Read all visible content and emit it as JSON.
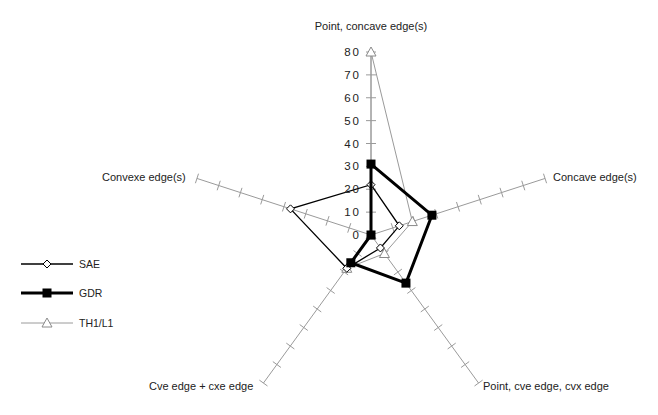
{
  "chart_data": {
    "type": "radar",
    "title": "",
    "axes": [
      "Point, concave edge(s)",
      "Concave edge(s)",
      "Point, cve edge, cvx edge",
      "Cve edge + cxe edge",
      "Convexe edge(s)"
    ],
    "radial_ticks": [
      0,
      10,
      20,
      30,
      40,
      50,
      60,
      70,
      80
    ],
    "rlim": [
      0,
      80
    ],
    "series": [
      {
        "name": "SAE",
        "values": [
          22,
          13,
          7,
          18,
          37
        ],
        "color": "#000000",
        "line_width": 1.3,
        "marker": "diamond-open"
      },
      {
        "name": "GDR",
        "values": [
          31,
          28,
          26,
          15,
          0
        ],
        "color": "#000000",
        "line_width": 3,
        "marker": "square-filled"
      },
      {
        "name": "TH1/L1",
        "values": [
          80,
          19,
          10,
          18,
          0
        ],
        "color": "#9a9a9a",
        "line_width": 1,
        "marker": "triangle-open"
      }
    ],
    "legend_position": "left"
  }
}
